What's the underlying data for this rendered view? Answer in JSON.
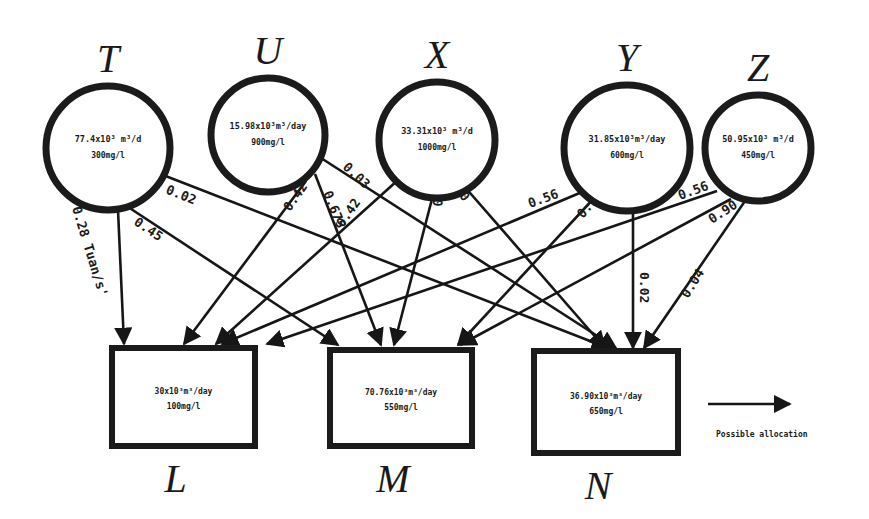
{
  "diagram": {
    "type": "allocation-network",
    "sources": [
      {
        "id": "T",
        "label": "T",
        "flow": "77.4x10³ m³/d",
        "conc": "300mg/l",
        "cx": 108,
        "cy": 148,
        "r": 62
      },
      {
        "id": "U",
        "label": "U",
        "flow": "15.98x10³m³/day",
        "conc": "900mg/l",
        "cx": 268,
        "cy": 135,
        "r": 57
      },
      {
        "id": "X",
        "label": "X",
        "flow": "33.31x10³ m³/d",
        "conc": "1000mg/l",
        "cx": 437,
        "cy": 140,
        "r": 58
      },
      {
        "id": "Y",
        "label": "Y",
        "flow": "31.85x10³m³/day",
        "conc": "600mg/l",
        "cx": 627,
        "cy": 148,
        "r": 63
      },
      {
        "id": "Z",
        "label": "Z",
        "flow": "50.95x10³ m³/d",
        "conc": "450mg/l",
        "cx": 758,
        "cy": 148,
        "r": 53
      }
    ],
    "sinks": [
      {
        "id": "L",
        "label": "L",
        "flow": "30x10³m³/day",
        "conc": "100mg/l",
        "x": 112,
        "y": 348,
        "w": 143,
        "h": 98
      },
      {
        "id": "M",
        "label": "M",
        "flow": "70.76x10³m³/day",
        "conc": "550mg/l",
        "x": 330,
        "y": 350,
        "w": 142,
        "h": 96
      },
      {
        "id": "N",
        "label": "N",
        "flow": "36.90x10³m³/day",
        "conc": "650mg/l",
        "x": 534,
        "y": 351,
        "w": 144,
        "h": 102
      }
    ],
    "edges": [
      {
        "from": "T",
        "to": "L",
        "label": "0.28 Tuan/s'",
        "x1": 118,
        "y1": 210,
        "x2": 124,
        "y2": 344
      },
      {
        "from": "T",
        "to": "M",
        "label": "0.45",
        "x1": 125,
        "y1": 205,
        "x2": 338,
        "y2": 345
      },
      {
        "from": "T",
        "to": "N",
        "label": "0.02",
        "x1": 163,
        "y1": 175,
        "x2": 608,
        "y2": 348
      },
      {
        "from": "U",
        "to": "L",
        "label": "0.42",
        "x1": 306,
        "y1": 181,
        "x2": 184,
        "y2": 344
      },
      {
        "from": "U",
        "to": "M",
        "label": "0.675",
        "x1": 315,
        "y1": 174,
        "x2": 381,
        "y2": 345
      },
      {
        "from": "U",
        "to": "N",
        "label": "0.03",
        "x1": 321,
        "y1": 158,
        "x2": 616,
        "y2": 348
      },
      {
        "from": "X",
        "to": "L",
        "label": "0.42",
        "x1": 398,
        "y1": 180,
        "x2": 216,
        "y2": 344
      },
      {
        "from": "X",
        "to": "M",
        "label": "0.675",
        "x1": 432,
        "y1": 199,
        "x2": 394,
        "y2": 345
      },
      {
        "from": "X",
        "to": "N",
        "label": "0.03",
        "x1": 464,
        "y1": 186,
        "x2": 605,
        "y2": 348
      },
      {
        "from": "Y",
        "to": "L",
        "label": "0.56",
        "x1": 582,
        "y1": 192,
        "x2": 222,
        "y2": 344
      },
      {
        "from": "Y",
        "to": "M",
        "label": "0.90",
        "x1": 596,
        "y1": 196,
        "x2": 458,
        "y2": 345
      },
      {
        "from": "Y",
        "to": "N",
        "label": "0.02",
        "x1": 633,
        "y1": 211,
        "x2": 633,
        "y2": 348
      },
      {
        "from": "Z",
        "to": "L",
        "label": "0.56",
        "x1": 717,
        "y1": 191,
        "x2": 267,
        "y2": 344
      },
      {
        "from": "Z",
        "to": "M",
        "label": "0.90",
        "x1": 731,
        "y1": 199,
        "x2": 460,
        "y2": 345
      },
      {
        "from": "Z",
        "to": "N",
        "label": "0.04",
        "x1": 745,
        "y1": 201,
        "x2": 644,
        "y2": 348
      }
    ],
    "edge_label_positions": [
      {
        "x": 72,
        "y": 208,
        "rot": 73
      },
      {
        "x": 133,
        "y": 224,
        "rot": 34
      },
      {
        "x": 165,
        "y": 193,
        "rot": 22
      },
      {
        "x": 290,
        "y": 212,
        "rot": -55
      },
      {
        "x": 323,
        "y": 193,
        "rot": 68
      },
      {
        "x": 342,
        "y": 168,
        "rot": 43
      },
      {
        "x": 343,
        "y": 228,
        "rot": -55
      },
      {
        "x": 442,
        "y": 207,
        "rot": -84
      },
      {
        "x": 471,
        "y": 196,
        "rot": 230
      },
      {
        "x": 530,
        "y": 208,
        "rot": -20
      },
      {
        "x": 583,
        "y": 219,
        "rot": -50
      },
      {
        "x": 640,
        "y": 272,
        "rot": 90
      },
      {
        "x": 680,
        "y": 200,
        "rot": -20
      },
      {
        "x": 712,
        "y": 224,
        "rot": -33
      },
      {
        "x": 688,
        "y": 299,
        "rot": -58
      }
    ],
    "legend": {
      "arrow_label": "Possible allocation",
      "arrow_x1": 708,
      "arrow_y1": 404,
      "arrow_x2": 790,
      "arrow_y2": 404
    }
  }
}
